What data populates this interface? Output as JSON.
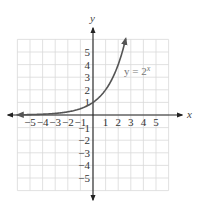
{
  "chart_data": {
    "type": "line",
    "title": "",
    "xlabel": "x",
    "ylabel": "y",
    "xlim": [
      -6,
      6
    ],
    "ylim": [
      -6,
      6
    ],
    "grid": true,
    "x_ticks": [
      -5,
      -4,
      -3,
      -2,
      -1,
      1,
      2,
      3,
      4,
      5
    ],
    "y_ticks": [
      -5,
      -4,
      -3,
      -2,
      -1,
      1,
      2,
      3,
      4,
      5
    ],
    "x_tick_labels": [
      "−5",
      "−4",
      "−3",
      "−2",
      "−1",
      "1",
      "2",
      "3",
      "4",
      "5"
    ],
    "y_tick_labels": [
      "−5",
      "−4",
      "−3",
      "−2",
      "−1",
      "1",
      "2",
      "3",
      "4",
      "5"
    ],
    "series": [
      {
        "name": "y = 2^x",
        "function": "2^x",
        "x_range": [
          -6,
          2.6
        ],
        "x": [
          -6,
          -5,
          -4,
          -3,
          -2,
          -1,
          0,
          1,
          2,
          2.5,
          2.6
        ],
        "y": [
          0.016,
          0.031,
          0.063,
          0.125,
          0.25,
          0.5,
          1,
          2,
          4,
          5.66,
          6.06
        ],
        "color": "#555555",
        "arrow_start": true,
        "arrow_end": true
      }
    ],
    "annotations": [
      {
        "text": "y = 2",
        "superscript": "x",
        "x": 2.3,
        "y": 3.3
      }
    ]
  },
  "labels": {
    "x_axis": "x",
    "y_axis": "y",
    "equation_base": "y = 2",
    "equation_exp": "x"
  },
  "colors": {
    "grid": "#d9d9d9",
    "axis": "#222222",
    "curve": "#555555"
  }
}
